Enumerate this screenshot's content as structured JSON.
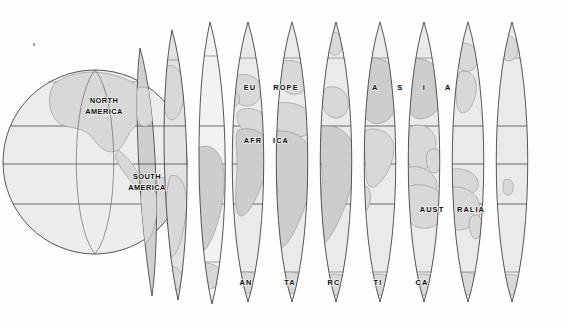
{
  "figure": {
    "background_color": "#ffffff",
    "ink_color": "#3a3a3a",
    "land_fill": "#d8d8d8",
    "ocean_fill": "#eaeaea",
    "label_color": "#0d0d0d"
  },
  "globe": {
    "name": "sphere",
    "center_x": 95,
    "center_y": 162,
    "radius": 92,
    "fill": "#ececec"
  },
  "latitudes": [
    {
      "name": "arctic-circle",
      "y": 58,
      "label": ""
    },
    {
      "name": "tropic-of-cancer",
      "y": 126,
      "label": ""
    },
    {
      "name": "equator",
      "y": 164,
      "label": ""
    },
    {
      "name": "tropic-of-capricorn",
      "y": 204,
      "label": ""
    },
    {
      "name": "antarctic-circle",
      "y": 272,
      "label": ""
    }
  ],
  "gores": [
    {
      "id": 1,
      "cx": 148,
      "half_width": 14,
      "peeled": true,
      "fill": "#e2e2e2"
    },
    {
      "id": 2,
      "cx": 176,
      "half_width": 16,
      "peeled": true,
      "fill": "#e8e8e8"
    },
    {
      "id": 3,
      "cx": 210,
      "half_width": 18,
      "peeled": true,
      "fill": "#ededed"
    },
    {
      "id": 4,
      "cx": 248,
      "half_width": 21,
      "peeled": false,
      "fill": "#eaeaea"
    },
    {
      "id": 5,
      "cx": 292,
      "half_width": 21,
      "peeled": false,
      "fill": "#eaeaea"
    },
    {
      "id": 6,
      "cx": 336,
      "half_width": 21,
      "peeled": false,
      "fill": "#eaeaea"
    },
    {
      "id": 7,
      "cx": 380,
      "half_width": 21,
      "peeled": false,
      "fill": "#eaeaea"
    },
    {
      "id": 8,
      "cx": 424,
      "half_width": 21,
      "peeled": false,
      "fill": "#eaeaea"
    },
    {
      "id": 9,
      "cx": 468,
      "half_width": 21,
      "peeled": false,
      "fill": "#eaeaea"
    },
    {
      "id": 10,
      "cx": 512,
      "half_width": 21,
      "peeled": false,
      "fill": "#eaeaea"
    }
  ],
  "labels": {
    "north_america_line1": "NORTH",
    "north_america_line2": "AMERICA",
    "south_america_line1": "SOUTH",
    "south_america_line2": "AMERICA",
    "europe_part1": "EU",
    "europe_part2": "ROPE",
    "africa_part1": "AFR",
    "africa_part2": "ICA",
    "asia_a1": "A",
    "asia_s": "S",
    "asia_i": "I",
    "asia_a2": "A",
    "australia_part1": "AUST",
    "australia_part2": "RALIA",
    "antarctica_part1": "AN",
    "antarctica_part2": "TA",
    "antarctica_part3": "RC",
    "antarctica_part4": "TI",
    "antarctica_part5": "CA"
  },
  "continents": [
    "NORTH AMERICA",
    "SOUTH AMERICA",
    "EUROPE",
    "AFRICA",
    "ASIA",
    "AUSTRALIA",
    "ANTARCTICA"
  ]
}
